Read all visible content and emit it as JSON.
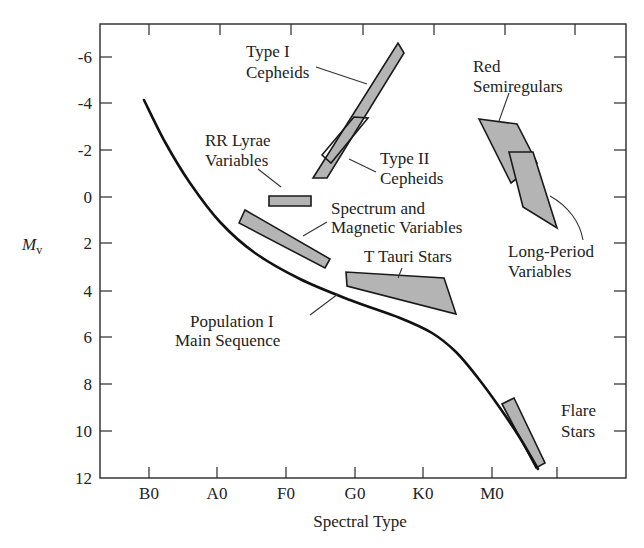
{
  "chart_data": {
    "type": "diagram-scatter-regions",
    "title": "",
    "xlabel": "Spectral Type",
    "ylabel": "M",
    "ylabel_sub": "v",
    "x_ticks": [
      "B0",
      "A0",
      "F0",
      "G0",
      "K0",
      "M0",
      ""
    ],
    "y_ticks": [
      "-6",
      "-4",
      "-2",
      "0",
      "2",
      "4",
      "6",
      "8",
      "10",
      "12"
    ],
    "ylim": [
      12,
      -7
    ],
    "grid": false,
    "curve": {
      "name": "Population I Main Sequence",
      "points_px": [
        [
          144,
          100
        ],
        [
          165,
          142
        ],
        [
          190,
          183
        ],
        [
          220,
          222
        ],
        [
          255,
          253
        ],
        [
          300,
          279
        ],
        [
          350,
          300
        ],
        [
          400,
          318
        ],
        [
          432,
          333
        ],
        [
          456,
          352
        ],
        [
          478,
          378
        ],
        [
          500,
          408
        ],
        [
          520,
          438
        ],
        [
          538,
          469
        ]
      ]
    },
    "regions": [
      {
        "name": "Type I Cepheids",
        "points_px": [
          [
            313,
            178
          ],
          [
            327,
            178
          ],
          [
            404,
            53
          ],
          [
            398,
            43
          ]
        ],
        "filled": true
      },
      {
        "name": "Type II Cepheids",
        "points_px": [
          [
            322,
            155
          ],
          [
            354,
            117
          ],
          [
            368,
            118
          ],
          [
            331,
            163
          ]
        ],
        "filled": false
      },
      {
        "name": "RR Lyrae Variables",
        "points_px": [
          [
            269,
            196
          ],
          [
            311,
            196
          ],
          [
            311,
            206
          ],
          [
            269,
            206
          ]
        ],
        "filled": true
      },
      {
        "name": "Spectrum and Magnetic Variables",
        "points_px": [
          [
            239,
            223
          ],
          [
            245,
            210
          ],
          [
            330,
            259
          ],
          [
            325,
            268
          ]
        ],
        "filled": true
      },
      {
        "name": "T Tauri Stars",
        "points_px": [
          [
            346,
            272
          ],
          [
            347,
            286
          ],
          [
            456,
            314
          ],
          [
            444,
            278
          ]
        ],
        "filled": true
      },
      {
        "name": "Red Semiregulars",
        "points_px": [
          [
            479,
            119
          ],
          [
            517,
            124
          ],
          [
            537,
            163
          ],
          [
            511,
            183
          ]
        ],
        "filled": true
      },
      {
        "name": "Long-Period Variables",
        "points_px": [
          [
            509,
            152
          ],
          [
            533,
            152
          ],
          [
            557,
            228
          ],
          [
            523,
            207
          ]
        ],
        "filled": true
      },
      {
        "name": "Flare Stars",
        "points_px": [
          [
            502,
            404
          ],
          [
            514,
            398
          ],
          [
            545,
            463
          ],
          [
            536,
            468
          ]
        ],
        "filled": true
      }
    ],
    "approx_values": [
      {
        "name": "Type I Cepheids",
        "spectral_range": "F5–K2",
        "Mv_range": [
          -6.5,
          0.5
        ]
      },
      {
        "name": "Type II Cepheids",
        "spectral_range": "F5–G5",
        "Mv_range": [
          -3.5,
          -1.5
        ]
      },
      {
        "name": "RR Lyrae Variables",
        "spectral_range": "A5–F5",
        "Mv_range": [
          0,
          0.5
        ]
      },
      {
        "name": "Spectrum and Magnetic Variables",
        "spectral_range": "A3–F8",
        "Mv_range": [
          0.5,
          3
        ]
      },
      {
        "name": "T Tauri Stars",
        "spectral_range": "G0–K5",
        "Mv_range": [
          3.5,
          5
        ]
      },
      {
        "name": "Red Semiregulars",
        "spectral_range": "K8–M5",
        "Mv_range": [
          -3.5,
          0.5
        ]
      },
      {
        "name": "Long-Period Variables",
        "spectral_range": "M2–M5",
        "Mv_range": [
          -1.5,
          1.5
        ]
      },
      {
        "name": "Flare Stars",
        "spectral_range": "M0–M5",
        "Mv_range": [
          8.5,
          11.5
        ]
      }
    ]
  },
  "labels": {
    "type1_l1": "Type I",
    "type1_l2": "Cepheids",
    "type2_l1": "Type II",
    "type2_l2": "Cepheids",
    "rr_l1": "RR Lyrae",
    "rr_l2": "Variables",
    "spec_l1": "Spectrum and",
    "spec_l2": "Magnetic Variables",
    "ttauri": "T Tauri Stars",
    "redsemi_l1": "Red",
    "redsemi_l2": "Semiregulars",
    "lpv_l1": "Long-Period",
    "lpv_l2": "Variables",
    "popI_l1": "Population I",
    "popI_l2": "Main Sequence",
    "flare_l1": "Flare",
    "flare_l2": "Stars"
  }
}
